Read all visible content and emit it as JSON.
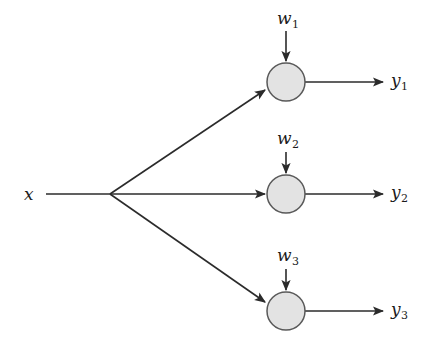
{
  "figure": {
    "type": "neural-network-fan-out-diagram",
    "background_color": "#ffffff",
    "stroke_color": "#2b2b2b",
    "node_fill_color": "#e3e3e3",
    "node_stroke_color": "#595959",
    "text_color": "#1b1b1b"
  },
  "input": {
    "label_base": "x",
    "label_sub": "",
    "x": 30,
    "y": 194
  },
  "branch_point": {
    "x": 110,
    "y": 194
  },
  "nodes": [
    {
      "id": "node-1",
      "cx": 286,
      "cy": 82,
      "r": 19,
      "weight_label_base": "w",
      "weight_label_sub": "1",
      "weight_label_x": 286,
      "weight_label_y": 18,
      "output_label_base": "y",
      "output_label_sub": "1",
      "output_label_x": 398,
      "output_label_y": 80
    },
    {
      "id": "node-2",
      "cx": 286,
      "cy": 194,
      "r": 19,
      "weight_label_base": "w",
      "weight_label_sub": "2",
      "weight_label_x": 286,
      "weight_label_y": 138,
      "output_label_base": "y",
      "output_label_sub": "2",
      "output_label_x": 398,
      "output_label_y": 192
    },
    {
      "id": "node-3",
      "cx": 286,
      "cy": 311,
      "r": 19,
      "weight_label_base": "w",
      "weight_label_sub": "3",
      "weight_label_x": 286,
      "weight_label_y": 255,
      "output_label_base": "y",
      "output_label_sub": "3",
      "output_label_x": 398,
      "output_label_y": 309
    }
  ],
  "output_arrow_end_x": 383,
  "weight_arrow_start_offset": 32
}
